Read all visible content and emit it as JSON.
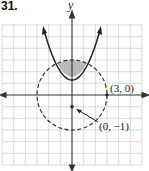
{
  "problem": {
    "number": "31."
  },
  "graph": {
    "x_axis_label": "",
    "y_axis_label": "y",
    "point_labels": [
      {
        "text": "(3, 0)",
        "x": 3,
        "y": 0
      },
      {
        "text": "(0, −1)",
        "x": 0,
        "y": -1
      }
    ],
    "grid": {
      "xmin": -6,
      "xmax": 6,
      "ymin": -6,
      "ymax": 6,
      "step": 1
    },
    "curves": [
      {
        "name": "parabola",
        "equation": "y = x^2 - 1",
        "style": "solid",
        "arrows": true
      },
      {
        "name": "circle",
        "equation": "x^2 + y^2 = 9",
        "style": "dashed"
      }
    ],
    "shaded_region": "y >= x^2 - 1 and x^2 + y^2 <= 9",
    "colors": {
      "shade": "#b9b9b9",
      "curve": "#222222",
      "grid": "#d0d0d0"
    }
  }
}
